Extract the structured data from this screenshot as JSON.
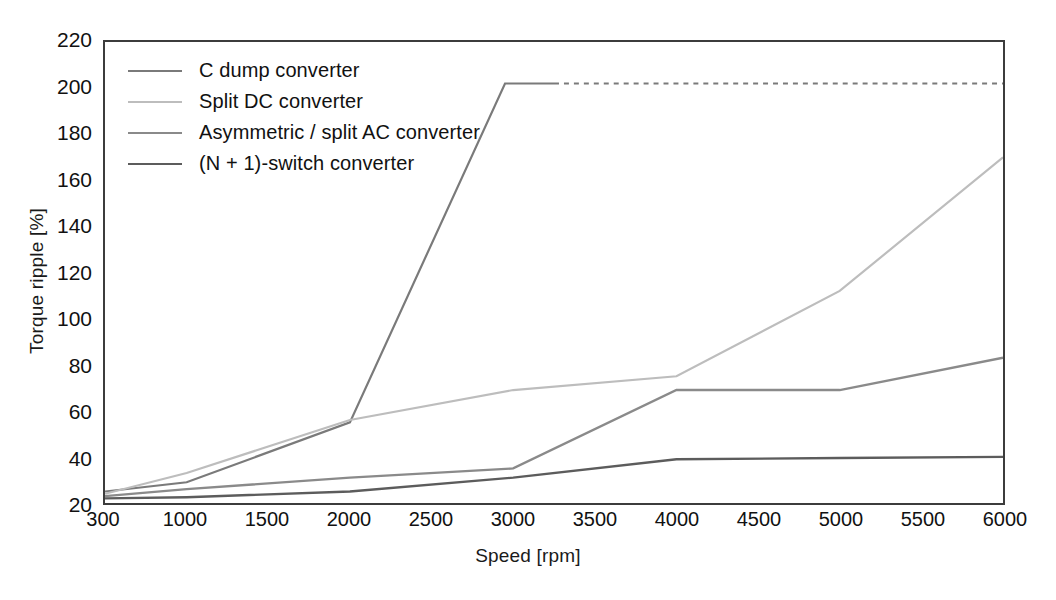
{
  "chart_data": {
    "type": "line",
    "title": "",
    "xlabel": "Speed [rpm]",
    "ylabel": "Torque ripple [%]",
    "xlim": [
      300,
      6000
    ],
    "ylim": [
      20,
      220
    ],
    "ytick_labels": [
      "220",
      "200",
      "180",
      "160",
      "140",
      "120",
      "100",
      "80",
      "60",
      "40",
      "20"
    ],
    "ytick_values": [
      220,
      200,
      180,
      160,
      140,
      120,
      100,
      80,
      60,
      40,
      20
    ],
    "xtick_labels": [
      "300",
      "1000",
      "1500",
      "2000",
      "2500",
      "3000",
      "3500",
      "4000",
      "4500",
      "5000",
      "5500",
      "6000"
    ],
    "xtick_values": [
      300,
      1000,
      1500,
      2000,
      2500,
      3000,
      3500,
      4000,
      4500,
      5000,
      5500,
      6000
    ],
    "grid": false,
    "legend_position": "upper-left",
    "series": [
      {
        "name": "C dump converter",
        "color": "#7a7a7a",
        "width": 2.2,
        "style": "solid-then-dashed",
        "dash_from_x": 3250,
        "x": [
          300,
          1000,
          2000,
          2950,
          3250,
          6000
        ],
        "y": [
          25,
          29,
          55,
          202,
          202,
          202
        ]
      },
      {
        "name": "Split DC converter",
        "color": "#bdbdbd",
        "width": 2.2,
        "style": "solid",
        "x": [
          300,
          1000,
          2000,
          3000,
          4000,
          5000,
          6000
        ],
        "y": [
          24,
          33,
          56,
          69,
          75,
          112,
          170
        ]
      },
      {
        "name": "Asymmetric / split AC converter",
        "color": "#8a8a8a",
        "width": 2.4,
        "style": "solid",
        "x": [
          300,
          1000,
          2000,
          3000,
          4000,
          5000,
          6000
        ],
        "y": [
          23,
          26,
          31,
          35,
          69,
          69,
          83
        ]
      },
      {
        "name": "(N + 1)-switch converter",
        "color": "#5c5c5c",
        "width": 2.4,
        "style": "solid",
        "x": [
          300,
          1000,
          2000,
          3000,
          4000,
          5000,
          6000
        ],
        "y": [
          22,
          22.5,
          25,
          31,
          39,
          39.5,
          40
        ]
      }
    ]
  }
}
